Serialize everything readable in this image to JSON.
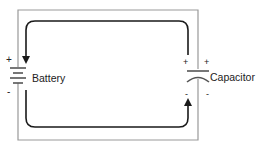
{
  "diagram": {
    "type": "circuit",
    "components": {
      "battery": {
        "label": "Battery",
        "plus": "+",
        "minus": "-"
      },
      "capacitor": {
        "label": "Capacitor",
        "plus_left": "+",
        "plus_right": "+",
        "minus_left": "-",
        "minus_right": "-"
      }
    },
    "current_flow": "arrows indicate charge flow from battery around circuit to capacitor",
    "colors": {
      "wire": "#999999",
      "arrow": "#1a1a1a",
      "text": "#222222"
    }
  }
}
